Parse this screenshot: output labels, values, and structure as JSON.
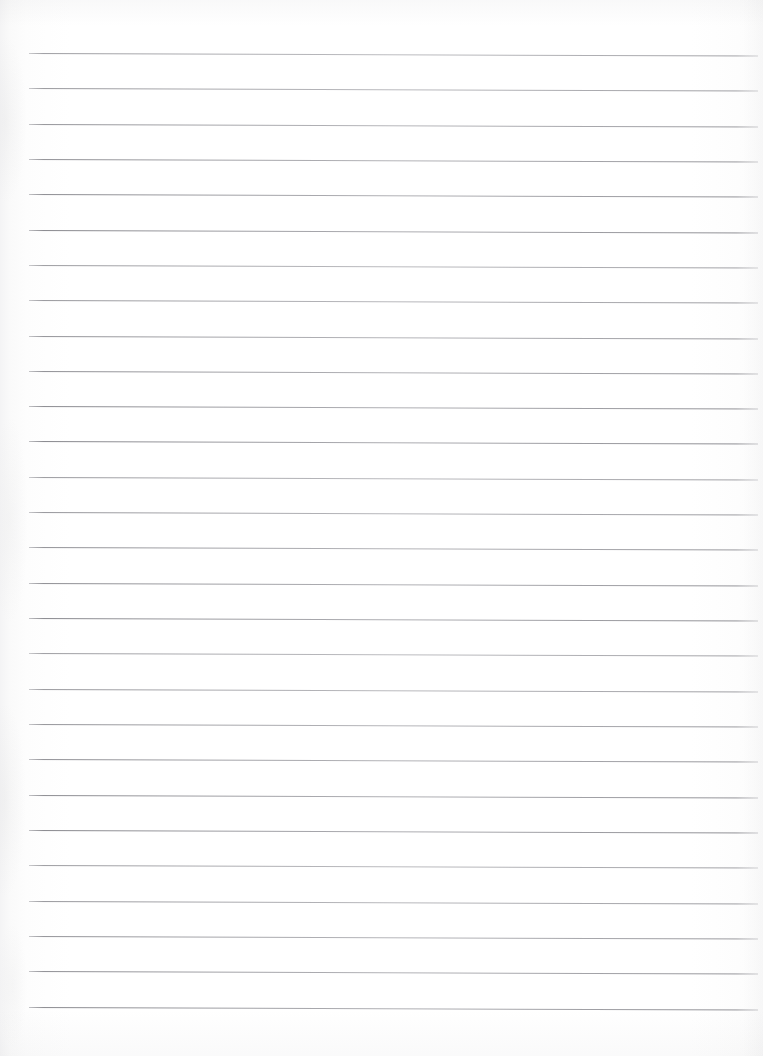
{
  "document": {
    "kind": "scanned-ruled-notebook-page",
    "title": "Blank Lined Paper",
    "page_width": 763,
    "page_height": 1056,
    "orientation": "portrait",
    "content_text": "",
    "handwriting_present": "no",
    "printed_text_present": "no"
  },
  "paper": {
    "background_color": "#fefefe",
    "surface_tint_color": "#fafafa",
    "edge_shadow_color": "#9a9aa0",
    "margin_rule_present": "no",
    "holes_present": "no"
  },
  "ruling": {
    "line_color": "#86868c",
    "line_thickness_px": 1,
    "line_count": 28,
    "first_line_y": 53,
    "last_line_y": 1006,
    "line_spacing_px": 35.3,
    "line_start_x": 29,
    "line_end_x": 758,
    "line_length_px": 729,
    "slant_px_over_width": 2.5,
    "lines_y": [
      53,
      88.3,
      123.6,
      158.9,
      194.2,
      229.6,
      264.9,
      300.2,
      335.5,
      370.8,
      406.1,
      441.4,
      476.8,
      512.1,
      547.4,
      582.7,
      618.0,
      653.3,
      688.6,
      724.0,
      759.3,
      794.6,
      829.9,
      865.2,
      900.5,
      935.8,
      971.2,
      1006.5
    ]
  },
  "labels": {
    "page_label": "Ruled notebook page",
    "rule_label": "horizontal ruled line"
  }
}
